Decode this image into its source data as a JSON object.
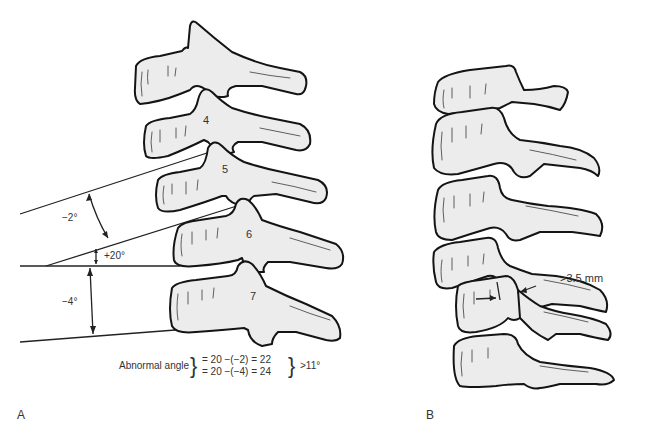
{
  "figure": {
    "panel_a": {
      "label": "A",
      "vertebra_labels": [
        "4",
        "5",
        "6",
        "7"
      ],
      "angles": {
        "upper": "−2°",
        "middle": "+20°",
        "lower": "−4°"
      },
      "formula": {
        "prefix": "Abnormal angle",
        "line1": "= 20 −(−2) = 22",
        "line2": "= 20 −(−4) = 24",
        "result": ">11°"
      }
    },
    "panel_b": {
      "label": "B",
      "measurement": ">3.5 mm"
    }
  },
  "colors": {
    "bone_fill": "#ececec",
    "outline": "#141414",
    "text": "#333333"
  }
}
